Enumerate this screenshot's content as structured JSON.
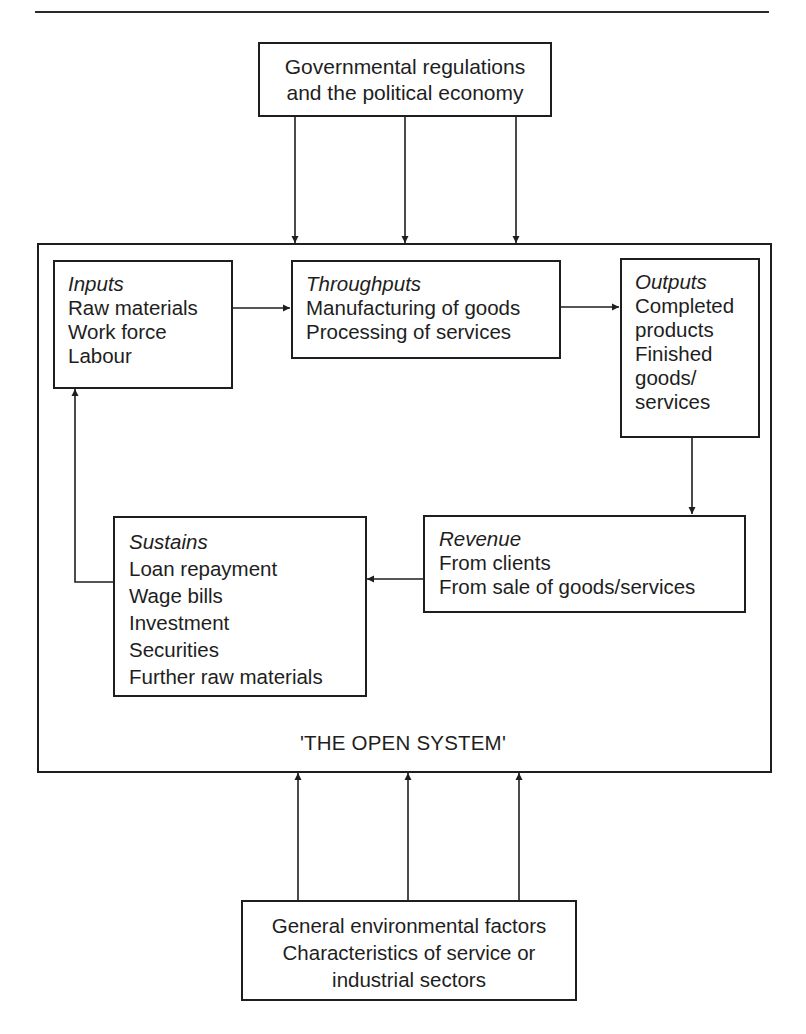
{
  "diagram": {
    "title": "'THE OPEN SYSTEM'",
    "top_box": {
      "lines": [
        "Governmental regulations",
        "and the political economy"
      ]
    },
    "bottom_box": {
      "lines": [
        "General environmental factors",
        "Characteristics of service or",
        "industrial sectors"
      ]
    },
    "nodes": {
      "inputs": {
        "title": "Inputs",
        "items": [
          "Raw materials",
          "Work force",
          "Labour"
        ]
      },
      "throughputs": {
        "title": "Throughputs",
        "items": [
          "Manufacturing of goods",
          "Processing of services"
        ]
      },
      "outputs": {
        "title": "Outputs",
        "items": [
          "Completed",
          "products",
          "Finished",
          "goods/",
          "services"
        ]
      },
      "revenue": {
        "title": "Revenue",
        "items": [
          "From clients",
          "From sale of goods/services"
        ]
      },
      "sustains": {
        "title": "Sustains",
        "items": [
          "Loan repayment",
          "Wage bills",
          "Investment",
          "Securities",
          "Further raw materials"
        ]
      }
    },
    "edges": [
      {
        "from": "top_box",
        "to": "open_system",
        "count": 3
      },
      {
        "from": "bottom_box",
        "to": "open_system",
        "count": 3
      },
      {
        "from": "inputs",
        "to": "throughputs"
      },
      {
        "from": "throughputs",
        "to": "outputs"
      },
      {
        "from": "outputs",
        "to": "revenue"
      },
      {
        "from": "revenue",
        "to": "sustains"
      },
      {
        "from": "sustains",
        "to": "inputs"
      }
    ],
    "colors": {
      "line": "#1e1e1e",
      "background": "#ffffff"
    }
  }
}
